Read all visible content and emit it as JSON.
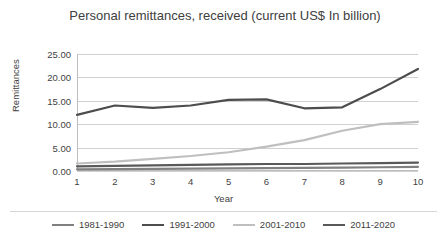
{
  "chart_data": {
    "type": "line",
    "title": "Personal remittances, received (current US$ In billion)",
    "xlabel": "Year",
    "ylabel": "Remittances",
    "categories": [
      "1",
      "2",
      "3",
      "4",
      "5",
      "6",
      "7",
      "8",
      "9",
      "10"
    ],
    "x": [
      1,
      2,
      3,
      4,
      5,
      6,
      7,
      8,
      9,
      10
    ],
    "ylim": [
      0,
      25
    ],
    "ytick_labels": [
      "0.00",
      "5.00",
      "10.00",
      "15.00",
      "20.00",
      "25.00"
    ],
    "ytick_values": [
      0,
      5,
      10,
      15,
      20,
      25
    ],
    "grid": true,
    "legend_position": "bottom",
    "series": [
      {
        "name": "1981-1990",
        "color": "#808080",
        "values": [
          0.35,
          0.4,
          0.45,
          0.5,
          0.55,
          0.6,
          0.65,
          0.7,
          0.8,
          0.9
        ]
      },
      {
        "name": "1991-2000",
        "color": "#4d4d4d",
        "values": [
          12.0,
          14.0,
          13.5,
          14.0,
          15.2,
          15.3,
          13.4,
          13.6,
          17.5,
          21.8
        ]
      },
      {
        "name": "2001-2010",
        "color": "#bfbfbf",
        "values": [
          1.6,
          2.0,
          2.6,
          3.2,
          4.0,
          5.2,
          6.6,
          8.6,
          10.0,
          10.5
        ]
      },
      {
        "name": "2011-2020",
        "color": "#595959",
        "values": [
          1.0,
          1.1,
          1.2,
          1.3,
          1.4,
          1.5,
          1.5,
          1.6,
          1.7,
          1.8
        ]
      }
    ]
  }
}
